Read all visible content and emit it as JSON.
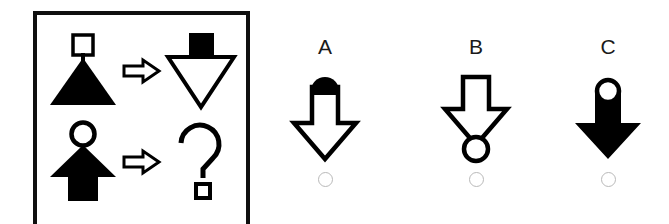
{
  "task": {
    "type": "visual-analogy-matrix",
    "panel": {
      "rows": [
        {
          "source": {
            "name": "black-triangle-up-with-white-square",
            "body_shape": "triangle-up",
            "body_fill": "black",
            "accessory_shape": "square",
            "accessory_fill": "white",
            "accessory_position": "top"
          },
          "operator": "⇒",
          "target": {
            "name": "white-triangle-down-with-black-square",
            "body_shape": "triangle-down",
            "body_fill": "white",
            "accessory_shape": "square",
            "accessory_fill": "black",
            "accessory_position": "top"
          }
        },
        {
          "source": {
            "name": "black-arrow-up-with-white-circle",
            "body_shape": "arrow-up",
            "body_fill": "black",
            "accessory_shape": "circle",
            "accessory_fill": "white",
            "accessory_position": "top"
          },
          "operator": "⇒",
          "target": {
            "name": "question-mark",
            "body_shape": "question-mark",
            "body_fill": "white"
          }
        }
      ]
    },
    "options": [
      {
        "label": "A",
        "name": "white-arrow-down-with-black-circle",
        "body_shape": "arrow-down",
        "body_fill": "white",
        "accessory_shape": "circle",
        "accessory_fill": "black",
        "accessory_position": "top",
        "selected": false
      },
      {
        "label": "B",
        "name": "white-arrow-down-with-white-circle-bottom",
        "body_shape": "arrow-down",
        "body_fill": "white",
        "accessory_shape": "circle",
        "accessory_fill": "white",
        "accessory_position": "bottom",
        "selected": false
      },
      {
        "label": "C",
        "name": "black-arrow-down-with-white-circle",
        "body_shape": "arrow-down",
        "body_fill": "black",
        "accessory_shape": "circle",
        "accessory_fill": "white",
        "accessory_position": "top",
        "selected": false
      }
    ]
  },
  "colors": {
    "ink": "#000000",
    "panel_border": "#0f0f0f",
    "radio_outline": "#b9b9b9",
    "background": "#ffffff"
  }
}
